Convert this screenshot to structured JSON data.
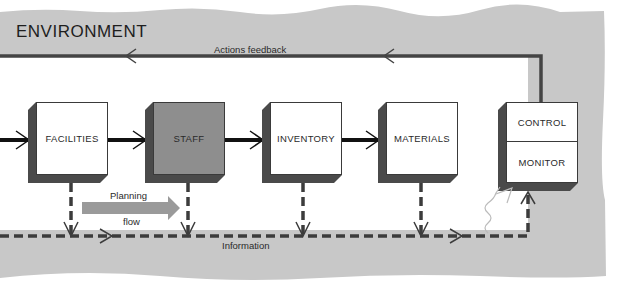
{
  "diagram": {
    "title": "ENVIRONMENT",
    "feedback_label": "Actions feedback",
    "information_label": "Information",
    "planning_label_top": "Planning",
    "planning_label_bottom": "flow",
    "nodes": [
      {
        "id": "facilities",
        "label": "FACILITIES",
        "fill": "#ffffff"
      },
      {
        "id": "staff",
        "label": "STAFF",
        "fill": "#8e8e8e"
      },
      {
        "id": "inventory",
        "label": "INVENTORY",
        "fill": "#ffffff"
      },
      {
        "id": "materials",
        "label": "MATERIALS",
        "fill": "#ffffff"
      }
    ],
    "control_unit": {
      "top": "CONTROL",
      "bottom": "MONITOR"
    },
    "colors": {
      "environment_band": "#c8c8c8",
      "box_shadow": "#4a4a4a",
      "arrow": "#111111",
      "dashed_line": "#3c3c3c",
      "planning_arrow": "#9a9a9a"
    }
  }
}
